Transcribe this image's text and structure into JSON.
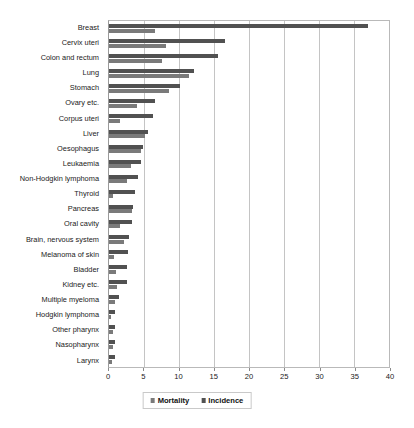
{
  "chart_data": {
    "type": "bar",
    "title": "",
    "xlabel": "",
    "ylabel": "",
    "orientation": "horizontal",
    "xlim": [
      0,
      40
    ],
    "xticks": [
      0,
      5,
      10,
      15,
      20,
      25,
      30,
      35,
      40
    ],
    "grid": true,
    "legend_position": "bottom",
    "categories": [
      "Breast",
      "Cervix uteri",
      "Colon and rectum",
      "Lung",
      "Stomach",
      "Ovary etc.",
      "Corpus uteri",
      "Liver",
      "Oesophagus",
      "Leukaemia",
      "Non-Hodgkin lymphoma",
      "Thyroid",
      "Pancreas",
      "Oral cavity",
      "Brain, nervous system",
      "Melanoma of skin",
      "Bladder",
      "Kidney etc.",
      "Multiple myeloma",
      "Hodgkin lymphoma",
      "Other pharynx",
      "Nasopharynx",
      "Larynx"
    ],
    "series": [
      {
        "name": "Incidence",
        "color": "#515151",
        "values": [
          37.0,
          16.5,
          15.5,
          12.2,
          10.2,
          6.6,
          6.3,
          5.6,
          4.8,
          4.5,
          4.2,
          3.7,
          3.4,
          3.3,
          2.8,
          2.7,
          2.6,
          2.6,
          1.4,
          0.8,
          0.9,
          0.9,
          0.8
        ]
      },
      {
        "name": "Mortality",
        "color": "#7a7a7a",
        "values": [
          6.5,
          8.2,
          7.6,
          11.4,
          8.6,
          4.0,
          1.5,
          5.2,
          4.5,
          3.2,
          2.6,
          0.6,
          3.3,
          1.6,
          2.1,
          0.7,
          1.0,
          1.2,
          0.9,
          0.3,
          0.5,
          0.5,
          0.4
        ]
      }
    ]
  },
  "legend": {
    "items": [
      {
        "label": "Mortality",
        "key": "mortality"
      },
      {
        "label": "Incidence",
        "key": "incidence"
      }
    ]
  }
}
